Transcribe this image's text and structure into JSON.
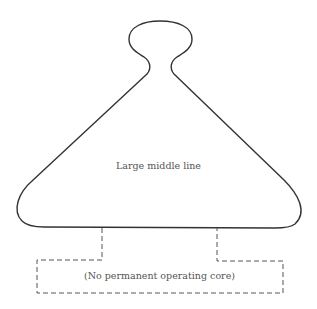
{
  "diagram": {
    "main_shape": {
      "label": "Large middle line",
      "stroke": "#333333"
    },
    "sub_box": {
      "label": "(No permanent operating core)",
      "stroke": "#555555",
      "style": "dashed"
    }
  }
}
